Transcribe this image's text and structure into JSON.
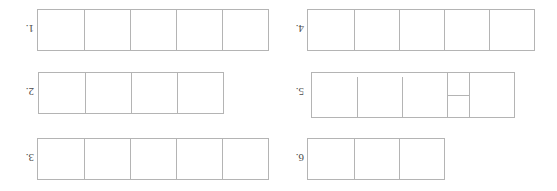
{
  "page": {
    "background_color": "#ffffff",
    "line_color": "#b4b4b4",
    "label_color": "#4a4a4a",
    "orientation_note": "sheet appears rotated 180 degrees (upside down)"
  },
  "strips": [
    {
      "id": "strip-1",
      "label": "1.",
      "cells": 5,
      "cell_width": 46,
      "cell_height": 40,
      "column": "right",
      "row": "bottom",
      "shape": "plain"
    },
    {
      "id": "strip-2",
      "label": "2.",
      "cells": 4,
      "cell_width": 46,
      "cell_height": 40,
      "column": "right",
      "row": "middle",
      "shape": "plain"
    },
    {
      "id": "strip-3",
      "label": "3.",
      "cells": 5,
      "cell_width": 46,
      "cell_height": 40,
      "column": "right",
      "row": "top",
      "shape": "plain"
    },
    {
      "id": "strip-4",
      "label": "4.",
      "cells": 5,
      "cell_width": 45,
      "cell_height": 40,
      "column": "left",
      "row": "bottom",
      "shape": "plain"
    },
    {
      "id": "strip-5",
      "label": "5.",
      "cells": 5,
      "cell_width": 45,
      "cell_height": 40,
      "column": "left",
      "row": "middle",
      "shape": "offset-with-split-column",
      "split_column_index": 2,
      "split_column_width": 22,
      "offset_cells": 3
    },
    {
      "id": "strip-6",
      "label": "6.",
      "cells": 3,
      "cell_width": 45,
      "cell_height": 40,
      "column": "left",
      "row": "top",
      "shape": "plain"
    }
  ],
  "labels": {
    "one": "1.",
    "two": "2.",
    "three": "3.",
    "four": "4.",
    "five": "5.",
    "six": "6."
  }
}
